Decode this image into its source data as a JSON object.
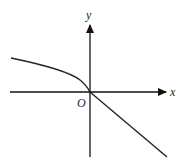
{
  "figure": {
    "type": "function-graph",
    "labels": {
      "x_axis": "x",
      "y_axis": "y",
      "origin": "O"
    },
    "colors": {
      "axis": "#111111",
      "curve": "#222222",
      "background": "#ffffff"
    }
  }
}
